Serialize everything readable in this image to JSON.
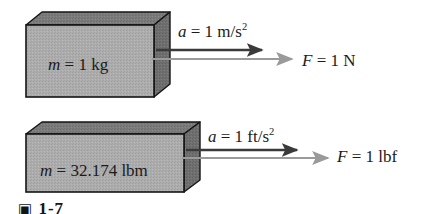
{
  "figure": {
    "caption_mark": "▣",
    "caption_number": "1-7",
    "background_color": "#ffffff",
    "box_front_color": "#ababab",
    "box_top_color": "#777777",
    "box_side_color": "#6e6e6e",
    "box_outline_color": "#151515",
    "accel_arrow_color": "#3a3a3a",
    "force_arrow_color": "#9a9a9a"
  },
  "systems": [
    {
      "id": "si-system",
      "mass": {
        "symbol": "m",
        "equals": " = ",
        "value": "1",
        "unit": "kg",
        "text": "m = 1 kg"
      },
      "acceleration": {
        "symbol": "a",
        "equals": " = ",
        "value": "1",
        "unit": "m/s",
        "exponent": "2",
        "text": "a = 1 m/s2"
      },
      "force": {
        "symbol": "F",
        "equals": " = ",
        "value": "1",
        "unit": "N",
        "text": "F = 1 N"
      }
    },
    {
      "id": "english-system",
      "mass": {
        "symbol": "m",
        "equals": " = ",
        "value": "32.174",
        "unit": "lbm",
        "text": "m = 32.174 lbm"
      },
      "acceleration": {
        "symbol": "a",
        "equals": " = ",
        "value": "1",
        "unit": "ft/s",
        "exponent": "2",
        "text": "a = 1 ft/s2"
      },
      "force": {
        "symbol": "F",
        "equals": " = ",
        "value": "1",
        "unit": "lbf",
        "text": "F = 1 lbf"
      }
    }
  ]
}
